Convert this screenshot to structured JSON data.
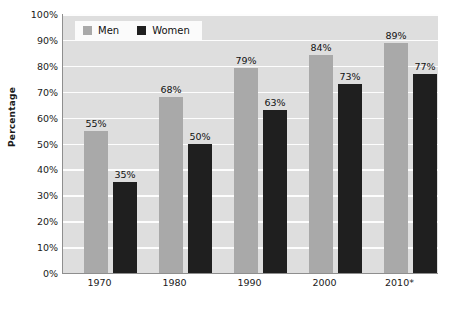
{
  "chart_data": {
    "type": "bar",
    "title": "",
    "subtitle": "",
    "xlabel": "",
    "ylabel": "Percentage",
    "categories": [
      "1970",
      "1980",
      "1990",
      "2000",
      "2010*"
    ],
    "series": [
      {
        "name": "Men",
        "color": "#a9a9a9",
        "values": [
          55,
          68,
          79,
          84,
          89
        ],
        "labels": [
          "55%",
          "68%",
          "79%",
          "84%",
          "89%"
        ]
      },
      {
        "name": "Women",
        "color": "#1f1f1f",
        "values": [
          35,
          50,
          63,
          73,
          77
        ],
        "labels": [
          "35%",
          "50%",
          "63%",
          "73%",
          "77%"
        ]
      }
    ],
    "ylim": [
      0,
      100
    ],
    "ytick_values": [
      0,
      10,
      20,
      30,
      40,
      50,
      60,
      70,
      80,
      90,
      100
    ],
    "ytick_labels": [
      "0%",
      "10%",
      "20%",
      "30%",
      "40%",
      "50%",
      "60%",
      "70%",
      "80%",
      "90%",
      "100%"
    ],
    "grid": "horizontal",
    "legend_position": "top-left-inside",
    "plot_background": "#dedede",
    "gridline_color": "#fdfdfd"
  },
  "legend": {
    "items": [
      {
        "label": "Men",
        "swatch": "men-swatch"
      },
      {
        "label": "Women",
        "swatch": "women-swatch"
      }
    ]
  }
}
